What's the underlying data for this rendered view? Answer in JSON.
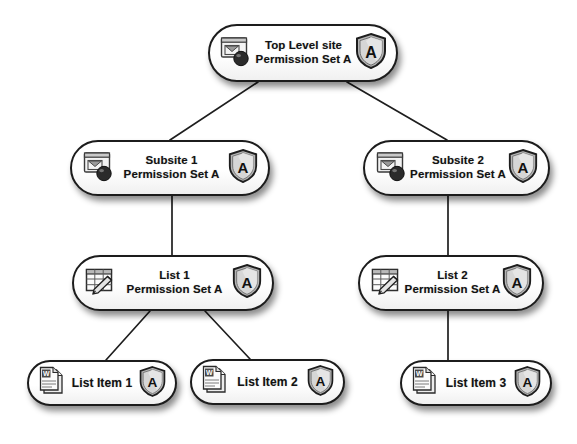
{
  "diagram": {
    "type": "tree",
    "style": {
      "node_fill": "#fdfdfd",
      "node_border": "#1c1c1c",
      "edge_color": "#1e1e1e",
      "text_color": "#121212",
      "background": "#ffffff"
    },
    "nodes": [
      {
        "id": "top",
        "line1": "Top Level site",
        "line2": "Permission Set A",
        "icon": "site-icon",
        "badge": "A",
        "badge_icon": "shield-icon",
        "level": 0
      },
      {
        "id": "sub1",
        "line1": "Subsite 1",
        "line2": "Permission Set A",
        "icon": "site-icon",
        "badge": "A",
        "badge_icon": "shield-icon",
        "level": 1
      },
      {
        "id": "sub2",
        "line1": "Subsite 2",
        "line2": "Permission Set A",
        "icon": "site-icon",
        "badge": "A",
        "badge_icon": "shield-icon",
        "level": 1
      },
      {
        "id": "list1",
        "line1": "List 1",
        "line2": "Permission Set A",
        "icon": "list-icon",
        "badge": "A",
        "badge_icon": "shield-icon",
        "level": 2
      },
      {
        "id": "list2",
        "line1": "List 2",
        "line2": "Permission Set A",
        "icon": "list-icon",
        "badge": "A",
        "badge_icon": "shield-icon",
        "level": 2
      },
      {
        "id": "item1",
        "line1": "List Item 1",
        "line2": "",
        "icon": "document-icon",
        "badge": "A",
        "badge_icon": "shield-icon",
        "level": 3
      },
      {
        "id": "item2",
        "line1": "List Item 2",
        "line2": "",
        "icon": "document-icon",
        "badge": "A",
        "badge_icon": "shield-icon",
        "level": 3
      },
      {
        "id": "item3",
        "line1": "List Item 3",
        "line2": "",
        "icon": "document-icon",
        "badge": "A",
        "badge_icon": "shield-icon",
        "level": 3
      }
    ],
    "edges": [
      {
        "from": "top",
        "to": "sub1",
        "shape": "diagonal"
      },
      {
        "from": "top",
        "to": "sub2",
        "shape": "diagonal"
      },
      {
        "from": "sub1",
        "to": "list1",
        "shape": "vertical"
      },
      {
        "from": "sub2",
        "to": "list2",
        "shape": "vertical"
      },
      {
        "from": "list1",
        "to": "item1",
        "shape": "diagonal"
      },
      {
        "from": "list1",
        "to": "item2",
        "shape": "diagonal"
      },
      {
        "from": "list2",
        "to": "item3",
        "shape": "vertical"
      }
    ]
  }
}
